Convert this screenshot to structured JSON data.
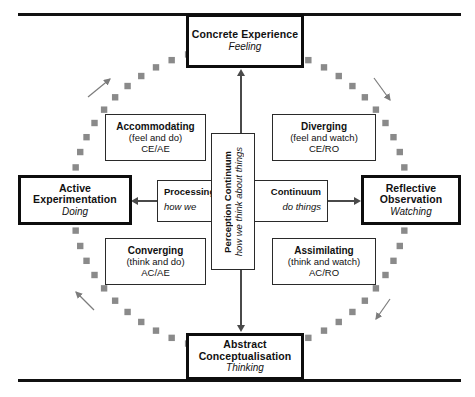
{
  "diagram": {
    "title_semantics": "Kolb experiential learning cycle and learning styles",
    "colors": {
      "stage_border": "#0d0d0d",
      "style_border": "#2a2a2a",
      "cycle_dash": "#8a8a8a",
      "arrow": "#4a4a4a",
      "rule": "#111111",
      "background": "#ffffff"
    },
    "stages": [
      {
        "id": "concrete-experience",
        "name": "Concrete Experience",
        "mode": "Feeling"
      },
      {
        "id": "reflective-observation",
        "name": "Reflective Observation",
        "mode": "Watching"
      },
      {
        "id": "abstract-conceptualisation",
        "name": "Abstract Conceptualisation",
        "mode": "Thinking"
      },
      {
        "id": "active-experimentation",
        "name": "Active Experimentation",
        "mode": "Doing"
      }
    ],
    "styles": [
      {
        "id": "accommodating",
        "name": "Accommodating",
        "descriptor": "(feel and do)",
        "code": "CE/AE"
      },
      {
        "id": "diverging",
        "name": "Diverging",
        "descriptor": "(feel and watch)",
        "code": "CE/RO"
      },
      {
        "id": "converging",
        "name": "Converging",
        "descriptor": "(think and do)",
        "code": "AC/AE"
      },
      {
        "id": "assimilating",
        "name": "Assimilating",
        "descriptor": "(think and watch)",
        "code": "AC/RO"
      }
    ],
    "continuums": {
      "horizontal": {
        "id": "processing-continuum",
        "label_left": "Processing",
        "label_right": "Continuum",
        "sub_left": "how we",
        "sub_right": "do things",
        "full_label": "Processing Continuum",
        "full_sub": "how we do things"
      },
      "vertical": {
        "id": "perception-continuum",
        "label": "Perception Continuum",
        "sub": "how we think about things"
      }
    },
    "cycle": {
      "direction": "clockwise",
      "dash_count": 60,
      "arrow_markers": [
        "top-left",
        "top-right",
        "bottom-right",
        "bottom-left"
      ]
    },
    "axis_arrows": [
      {
        "id": "arrow-up",
        "points_to": "Concrete Experience"
      },
      {
        "id": "arrow-right",
        "points_to": "Reflective Observation"
      },
      {
        "id": "arrow-down",
        "points_to": "Abstract Conceptualisation"
      },
      {
        "id": "arrow-left",
        "points_to": "Active Experimentation"
      }
    ]
  }
}
